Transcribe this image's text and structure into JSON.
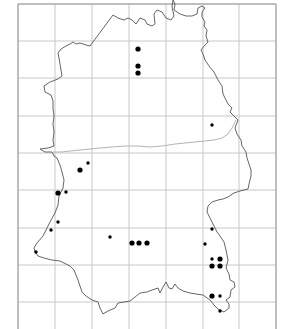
{
  "map": {
    "type": "distribution-map",
    "colors": {
      "background": "#ffffff",
      "grid": "#c8c8c8",
      "frame": "#9a9a9a",
      "county_boundary": "#555555",
      "internal_line": "#b4b4b4",
      "record_dot": "#000000"
    },
    "grid": {
      "vertical_x": [
        18,
        55,
        92,
        129,
        166,
        203,
        239,
        276
      ],
      "horizontal_y": [
        4,
        41,
        78,
        116,
        153,
        190,
        228,
        265,
        302
      ]
    },
    "records": [
      {
        "x": 138,
        "y": 49,
        "size": "large"
      },
      {
        "x": 138,
        "y": 66,
        "size": "large"
      },
      {
        "x": 138,
        "y": 73,
        "size": "large"
      },
      {
        "x": 212,
        "y": 125,
        "size": "small"
      },
      {
        "x": 88,
        "y": 163,
        "size": "small"
      },
      {
        "x": 80,
        "y": 170,
        "size": "large"
      },
      {
        "x": 58,
        "y": 193,
        "size": "large"
      },
      {
        "x": 66,
        "y": 192,
        "size": "small"
      },
      {
        "x": 58,
        "y": 222,
        "size": "small"
      },
      {
        "x": 51,
        "y": 230,
        "size": "small"
      },
      {
        "x": 36,
        "y": 252,
        "size": "small"
      },
      {
        "x": 110,
        "y": 237,
        "size": "small"
      },
      {
        "x": 132,
        "y": 243,
        "size": "large"
      },
      {
        "x": 139,
        "y": 243,
        "size": "large"
      },
      {
        "x": 147,
        "y": 243,
        "size": "large"
      },
      {
        "x": 212,
        "y": 229,
        "size": "small"
      },
      {
        "x": 205,
        "y": 244,
        "size": "small"
      },
      {
        "x": 212,
        "y": 259,
        "size": "small"
      },
      {
        "x": 220,
        "y": 259,
        "size": "large"
      },
      {
        "x": 212,
        "y": 266,
        "size": "large"
      },
      {
        "x": 220,
        "y": 266,
        "size": "large"
      },
      {
        "x": 212,
        "y": 296,
        "size": "large"
      },
      {
        "x": 220,
        "y": 296,
        "size": "small"
      },
      {
        "x": 220,
        "y": 311,
        "size": "small"
      }
    ]
  }
}
